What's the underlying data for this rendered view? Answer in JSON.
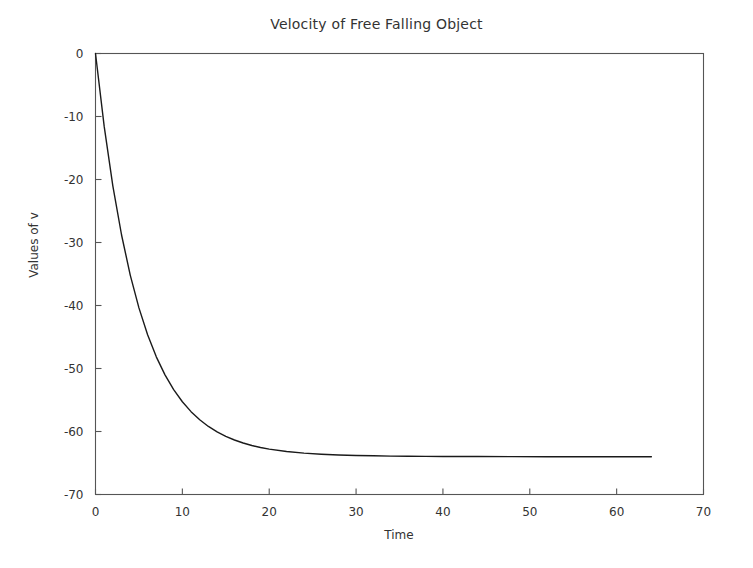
{
  "chart_data": {
    "type": "line",
    "title": "Velocity of Free Falling Object",
    "xlabel": "Time",
    "ylabel": "Values of v",
    "xlim": [
      0,
      70
    ],
    "ylim": [
      -70,
      0
    ],
    "xticks": [
      0,
      10,
      20,
      30,
      40,
      50,
      60,
      70
    ],
    "xtick_labels": [
      "0",
      "10",
      "20",
      "30",
      "40",
      "50",
      "60",
      "70"
    ],
    "yticks": [
      0,
      -10,
      -20,
      -30,
      -40,
      -50,
      -60,
      -70
    ],
    "ytick_labels": [
      "0",
      "-10",
      "-20",
      "-30",
      "-40",
      "-50",
      "-60",
      "-70"
    ],
    "grid": false,
    "legend": false,
    "line_color": "#1a1a1a",
    "line_width": 1.4,
    "asymptote": -63.8,
    "series": [
      {
        "name": "v",
        "x": [
          0,
          1,
          2,
          3,
          4,
          5,
          6,
          7,
          8,
          9,
          10,
          11,
          12,
          13,
          14,
          15,
          16,
          17,
          18,
          19,
          20,
          22,
          24,
          26,
          28,
          30,
          32,
          34,
          36,
          38,
          40,
          44,
          48,
          52,
          56,
          60,
          64
        ],
        "y": [
          0,
          -11.57,
          -21.05,
          -28.81,
          -35.17,
          -40.38,
          -44.65,
          -48.15,
          -51.01,
          -53.36,
          -55.28,
          -56.85,
          -58.14,
          -59.2,
          -60.06,
          -60.77,
          -61.35,
          -61.83,
          -62.22,
          -62.54,
          -62.8,
          -63.18,
          -63.44,
          -63.61,
          -63.73,
          -63.8,
          -63.86,
          -63.91,
          -63.93,
          -63.95,
          -63.97,
          -63.98,
          -63.99,
          -64.0,
          -64.0,
          -64.0,
          -64.0
        ]
      }
    ]
  },
  "figure": {
    "title": "Velocity of Free Falling Object",
    "xlabel": "Time",
    "ylabel": "Values of v"
  }
}
